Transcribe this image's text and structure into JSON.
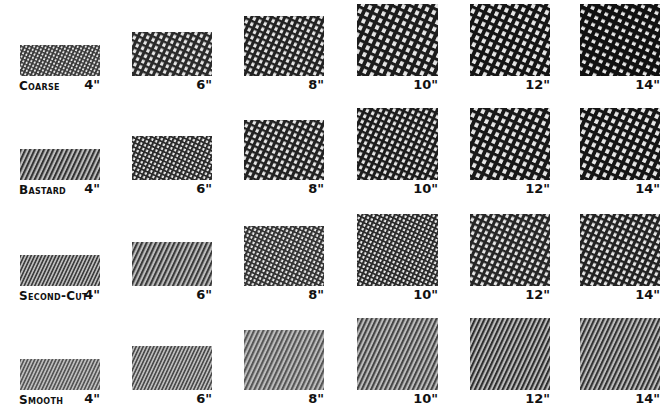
{
  "sizes": [
    "4\"",
    "6\"",
    "8\"",
    "10\"",
    "12\"",
    "14\""
  ],
  "rows": [
    {
      "grade": "Coarse",
      "swatches": [
        {
          "size": "4\"",
          "pattern": "crosshatch",
          "density": "fine-dot",
          "tone": "#3a3a3a"
        },
        {
          "size": "6\"",
          "pattern": "crosshatch",
          "density": "medium",
          "tone": "#2a2a2a"
        },
        {
          "size": "8\"",
          "pattern": "crosshatch",
          "density": "medium",
          "tone": "#222222"
        },
        {
          "size": "10\"",
          "pattern": "crosshatch",
          "density": "open",
          "tone": "#1c1c1c"
        },
        {
          "size": "12\"",
          "pattern": "crosshatch",
          "density": "open",
          "tone": "#151515"
        },
        {
          "size": "14\"",
          "pattern": "crosshatch",
          "density": "teeth",
          "tone": "#111111"
        }
      ]
    },
    {
      "grade": "Bastard",
      "swatches": [
        {
          "size": "4\"",
          "pattern": "diagonal",
          "density": "fine",
          "tone": "#333333"
        },
        {
          "size": "6\"",
          "pattern": "crosshatch",
          "density": "fine",
          "tone": "#2a2a2a"
        },
        {
          "size": "8\"",
          "pattern": "crosshatch",
          "density": "medium",
          "tone": "#222222"
        },
        {
          "size": "10\"",
          "pattern": "crosshatch",
          "density": "medium",
          "tone": "#1c1c1c"
        },
        {
          "size": "12\"",
          "pattern": "crosshatch",
          "density": "open",
          "tone": "#181818"
        },
        {
          "size": "14\"",
          "pattern": "crosshatch",
          "density": "open",
          "tone": "#151515"
        }
      ]
    },
    {
      "grade": "Second-Cut",
      "swatches": [
        {
          "size": "4\"",
          "pattern": "diagonal",
          "density": "very-fine",
          "tone": "#3d3d3d"
        },
        {
          "size": "6\"",
          "pattern": "diagonal",
          "density": "fine",
          "tone": "#3a3a3a"
        },
        {
          "size": "8\"",
          "pattern": "crosshatch",
          "density": "fine",
          "tone": "#333333"
        },
        {
          "size": "10\"",
          "pattern": "crosshatch",
          "density": "fine",
          "tone": "#2a2a2a"
        },
        {
          "size": "12\"",
          "pattern": "crosshatch",
          "density": "medium",
          "tone": "#262626"
        },
        {
          "size": "14\"",
          "pattern": "crosshatch",
          "density": "medium",
          "tone": "#222222"
        }
      ]
    },
    {
      "grade": "Smooth",
      "swatches": [
        {
          "size": "4\"",
          "pattern": "diagonal",
          "density": "very-fine",
          "tone": "#555555"
        },
        {
          "size": "6\"",
          "pattern": "diagonal",
          "density": "very-fine",
          "tone": "#4a4a4a"
        },
        {
          "size": "8\"",
          "pattern": "diagonal",
          "density": "fine",
          "tone": "#555555"
        },
        {
          "size": "10\"",
          "pattern": "diagonal",
          "density": "fine",
          "tone": "#444444"
        },
        {
          "size": "12\"",
          "pattern": "diagonal",
          "density": "fine",
          "tone": "#2e2e2e"
        },
        {
          "size": "14\"",
          "pattern": "diagonal",
          "density": "fine",
          "tone": "#333333"
        }
      ]
    }
  ]
}
